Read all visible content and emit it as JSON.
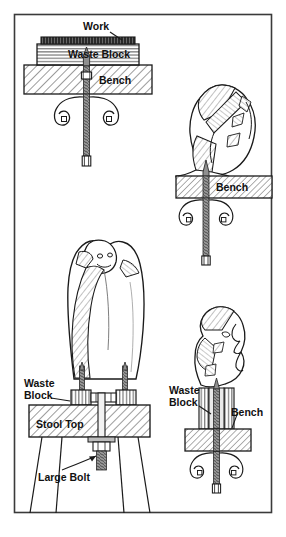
{
  "figure": {
    "background_color": "#ffffff",
    "frame_color": "#3a3a3a",
    "ink_color": "#1a1a1a",
    "hatch_color": "#555555",
    "bolt_color": "#8e8e8e",
    "frame": {
      "x": 14,
      "y": 14,
      "width": 258,
      "height": 499
    }
  },
  "panels": [
    {
      "id": "top-left",
      "name": "work-clamped-to-bench",
      "labels": [
        {
          "key": "work",
          "text": "Work",
          "x": 83,
          "y": 30,
          "anchor": "start",
          "size": 10.5
        },
        {
          "key": "waste_block",
          "text": "Waste  Block",
          "x": 68,
          "y": 57,
          "anchor": "start",
          "size": 10.5
        },
        {
          "key": "bench",
          "text": "Bench",
          "x": 99,
          "y": 84,
          "anchor": "start",
          "size": 10.5
        }
      ]
    },
    {
      "id": "top-right",
      "name": "rough-carving-on-bench",
      "labels": [
        {
          "key": "bench",
          "text": "Bench",
          "x": 216,
          "y": 184,
          "anchor": "start",
          "size": 10.5
        }
      ]
    },
    {
      "id": "center-left",
      "name": "tall-figure-on-stool",
      "labels": [
        {
          "key": "waste_block_line1",
          "text": "Waste",
          "x": 24,
          "y": 386,
          "anchor": "start",
          "size": 10.5
        },
        {
          "key": "waste_block_line2",
          "text": "Block",
          "x": 24,
          "y": 398,
          "anchor": "start",
          "size": 10.5
        },
        {
          "key": "stool_top",
          "text": "Stool  Top",
          "x": 33,
          "y": 430,
          "anchor": "start",
          "size": 10.5
        },
        {
          "key": "large_bolt",
          "text": "Large Bolt",
          "x": 58,
          "y": 478,
          "anchor": "start",
          "size": 10.5
        }
      ]
    },
    {
      "id": "bottom-right",
      "name": "head-carving-on-bench",
      "labels": [
        {
          "key": "waste_block_line1",
          "text": "Waste",
          "x": 170,
          "y": 392,
          "anchor": "start",
          "size": 10.5
        },
        {
          "key": "waste_block_line2",
          "text": "Block",
          "x": 170,
          "y": 404,
          "anchor": "start",
          "size": 10.5
        },
        {
          "key": "bench",
          "text": "Bench",
          "x": 231,
          "y": 409,
          "anchor": "start",
          "size": 10.5
        }
      ]
    }
  ]
}
